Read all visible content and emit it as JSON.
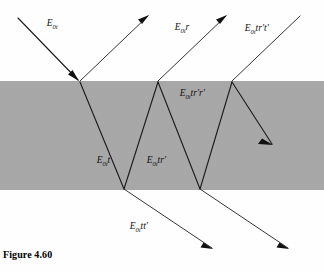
{
  "figure": {
    "caption": "Figure 4.60",
    "slab_color": "#a8a8a8",
    "background_color": "#ffffff",
    "ray_color": "#1a1a1a"
  },
  "labels": {
    "incident": {
      "base": "E",
      "sub": "0i",
      "suffix": "",
      "x": 30,
      "y": 26
    },
    "reflected": {
      "base": "E",
      "sub": "0i",
      "suffix": "r",
      "x": 158,
      "y": 30
    },
    "transmitted_out_top": {
      "base": "E",
      "sub": "0i",
      "suffix": "tr′t′",
      "x": 228,
      "y": 31
    },
    "internal_double": {
      "base": "E",
      "sub": "0i",
      "suffix": "tr′r′",
      "x": 163,
      "y": 96
    },
    "internal_t": {
      "base": "E",
      "sub": "0i",
      "suffix": "t",
      "x": 80,
      "y": 163
    },
    "internal_tr": {
      "base": "E",
      "sub": "0i",
      "suffix": "tr′",
      "x": 130,
      "y": 163
    },
    "transmitted_bottom": {
      "base": "E",
      "sub": "0i",
      "suffix": "tt′",
      "x": 113,
      "y": 229
    }
  },
  "geometry": {
    "slab": {
      "x": 0,
      "y": 81,
      "width": 324,
      "height": 109
    },
    "incidence_points": {
      "p1_top": {
        "x": 80,
        "y": 82
      },
      "p2_bottom": {
        "x": 124,
        "y": 189
      },
      "p3_top": {
        "x": 158,
        "y": 82
      },
      "p4_bottom": {
        "x": 200,
        "y": 189
      },
      "p5_top": {
        "x": 232,
        "y": 82
      }
    }
  },
  "rays": {
    "incident_in": "E0i entering from upper left",
    "reflected_up": "E0i r reflecting up-right",
    "transmitted_down": "E0i t refracting down into slab",
    "internal_reflect_1": "E0i tr' reflecting up at bottom face",
    "exit_bottom_1": "E0i tt' exiting bottom",
    "internal_reflect_2": "E0i tr'r' reflecting down at top face",
    "exit_top_1": "E0i tr't' exiting top",
    "exit_bottom_2": "second bottom exit ray",
    "internal_ray_3": "third internal segment down-right"
  }
}
